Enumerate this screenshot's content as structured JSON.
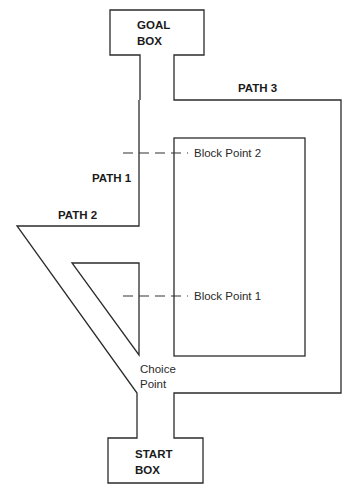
{
  "diagram": {
    "goal_box": {
      "line1": "GOAL",
      "line2": "BOX"
    },
    "start_box": {
      "line1": "START",
      "line2": "BOX"
    },
    "paths": [
      {
        "label": "PATH 1"
      },
      {
        "label": "PATH 2"
      },
      {
        "label": "PATH 3"
      }
    ],
    "block_points": [
      {
        "label": "Block Point 2"
      },
      {
        "label": "Block Point 1"
      }
    ],
    "choice_point": {
      "line1": "Choice",
      "line2": "Point"
    },
    "colors": {
      "line": "#2b2b2b",
      "background": "#ffffff"
    }
  }
}
